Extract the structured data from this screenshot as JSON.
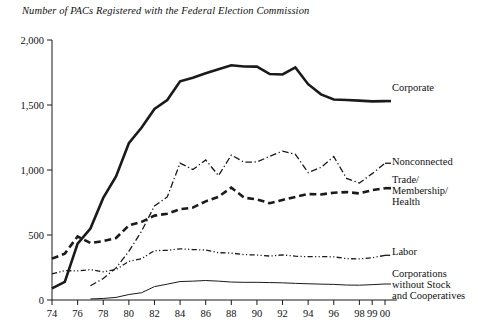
{
  "chart_data": {
    "type": "line",
    "title": "Number of PACs Registered with the Federal Election Commission",
    "xlabel": "",
    "ylabel": "",
    "ylim": [
      0,
      2000
    ],
    "yticks": [
      0,
      500,
      1000,
      1500,
      2000
    ],
    "ytick_labels": [
      "0",
      "500",
      "1,000",
      "1,500",
      "2,000"
    ],
    "grid": false,
    "legend_position": "right-inline",
    "x": [
      1974,
      1975,
      1976,
      1977,
      1978,
      1979,
      1980,
      1981,
      1982,
      1983,
      1984,
      1985,
      1986,
      1987,
      1988,
      1989,
      1990,
      1991,
      1992,
      1993,
      1994,
      1995,
      1996,
      1997,
      1998,
      1999,
      2000
    ],
    "xtick_years": [
      1974,
      1976,
      1978,
      1980,
      1982,
      1984,
      1986,
      1988,
      1990,
      1992,
      1994,
      1996,
      1998,
      1999,
      2000
    ],
    "xtick_labels": [
      "74",
      "76",
      "78",
      "80",
      "82",
      "84",
      "86",
      "88",
      "90",
      "92",
      "94",
      "96",
      "98",
      "99",
      "00"
    ],
    "series": [
      {
        "name": "Corporate",
        "style": "solid",
        "width": 2.6,
        "color": "#1a1a1a",
        "values": [
          89,
          139,
          433,
          550,
          785,
          950,
          1206,
          1327,
          1469,
          1538,
          1682,
          1710,
          1744,
          1775,
          1806,
          1796,
          1795,
          1738,
          1735,
          1789,
          1660,
          1582,
          1542,
          1539,
          1534,
          1528,
          1530
        ]
      },
      {
        "name": "Nonconnected",
        "style": "dash-dot",
        "width": 1.3,
        "color": "#1a1a1a",
        "values": [
          0,
          0,
          0,
          110,
          165,
          247,
          374,
          531,
          723,
          793,
          1053,
          1003,
          1077,
          957,
          1115,
          1060,
          1062,
          1105,
          1145,
          1121,
          980,
          1020,
          1103,
          935,
          900,
          972,
          1052
        ]
      },
      {
        "name": "Trade/Membership/Health",
        "style": "dash",
        "width": 2.6,
        "color": "#1a1a1a",
        "values": [
          318,
          357,
          489,
          438,
          453,
          477,
          574,
          601,
          649,
          664,
          698,
          711,
          759,
          794,
          865,
          787,
          774,
          745,
          770,
          793,
          815,
          812,
          825,
          830,
          820,
          845,
          860
        ]
      },
      {
        "name": "Labor",
        "style": "dash-dot-dot",
        "width": 1.3,
        "color": "#1a1a1a",
        "values": [
          201,
          226,
          224,
          234,
          217,
          234,
          297,
          318,
          380,
          382,
          394,
          388,
          384,
          364,
          361,
          349,
          346,
          338,
          347,
          337,
          333,
          334,
          332,
          318,
          316,
          325,
          344
        ]
      },
      {
        "name": "Corporations without Stock and Cooperatives",
        "style": "solid",
        "width": 1.0,
        "color": "#1a1a1a",
        "values": [
          0,
          0,
          0,
          8,
          12,
          20,
          42,
          56,
          103,
          122,
          142,
          145,
          150,
          145,
          138,
          136,
          136,
          134,
          132,
          128,
          125,
          122,
          120,
          115,
          114,
          118,
          123
        ]
      }
    ]
  },
  "legend": {
    "corporate": "Corporate",
    "nonconnected": "Nonconnected",
    "trade_line1": "Trade/",
    "trade_line2": "Membership/",
    "trade_line3": "Health",
    "labor": "Labor",
    "corp_nostock_line1": "Corporations",
    "corp_nostock_line2": "without Stock",
    "corp_nostock_line3": "and Cooperatives"
  }
}
